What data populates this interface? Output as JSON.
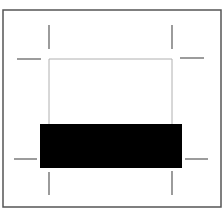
{
  "diagram": {
    "colors": {
      "background": "#ffffff",
      "frame": "#555555",
      "trim_box": "#b0b0b0",
      "crop_marks": "#666666",
      "bar": "#000000"
    },
    "frame": {
      "x": 3,
      "y": 10,
      "w": 218,
      "h": 197
    },
    "trim_box": {
      "x": 49,
      "y": 59,
      "w": 123,
      "h": 100
    },
    "bar": {
      "x": 40,
      "y": 124,
      "w": 142,
      "h": 44
    },
    "crop_marks": [
      {
        "name": "top-left-vertical",
        "x1": 49,
        "y1": 25,
        "x2": 49,
        "y2": 49
      },
      {
        "name": "top-left-horizontal",
        "x1": 17,
        "y1": 59,
        "x2": 41,
        "y2": 59
      },
      {
        "name": "top-right-vertical",
        "x1": 172,
        "y1": 25,
        "x2": 172,
        "y2": 49
      },
      {
        "name": "top-right-horizontal",
        "x1": 180,
        "y1": 58,
        "x2": 204,
        "y2": 58
      },
      {
        "name": "bottom-left-horizontal",
        "x1": 14,
        "y1": 159,
        "x2": 37,
        "y2": 159
      },
      {
        "name": "bottom-left-vertical",
        "x1": 49,
        "y1": 172,
        "x2": 49,
        "y2": 195
      },
      {
        "name": "bottom-right-horizontal",
        "x1": 185,
        "y1": 159,
        "x2": 208,
        "y2": 159
      },
      {
        "name": "bottom-right-vertical",
        "x1": 172,
        "y1": 171,
        "x2": 172,
        "y2": 195
      }
    ]
  }
}
